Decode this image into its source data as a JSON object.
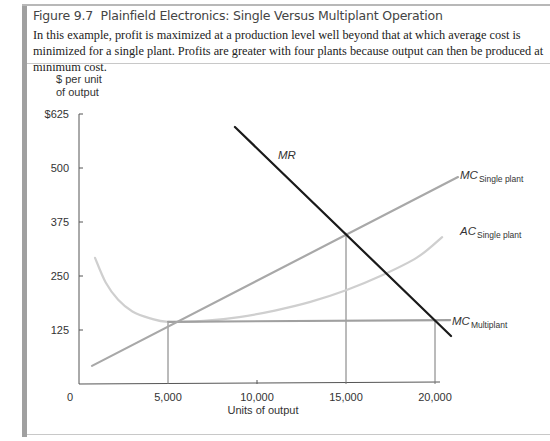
{
  "figure": {
    "number": "Figure 9.7",
    "title": "Plainfield Electronics: Single Versus Multiplant Operation",
    "description": "In this example, profit is maximized at a production level well beyond that at which average cost is minimized for a single plant. Profits are greater with four plants because output can then be produced at minimum cost."
  },
  "chart_data": {
    "type": "line",
    "title": "Plainfield Electronics: Single Versus Multiplant Operation",
    "xlabel": "Units of output",
    "ylabel": "$ per unit of output",
    "ylabel_lines": [
      "$ per unit",
      "of output"
    ],
    "xlim": [
      0,
      20000
    ],
    "ylim": [
      0,
      625
    ],
    "x_ticks": [
      {
        "value": 0,
        "label": "0"
      },
      {
        "value": 5000,
        "label": "5,000"
      },
      {
        "value": 10000,
        "label": "10,000"
      },
      {
        "value": 15000,
        "label": "15,000"
      },
      {
        "value": 20000,
        "label": "20,000"
      }
    ],
    "y_ticks": [
      {
        "value": 125,
        "label": "125"
      },
      {
        "value": 250,
        "label": "250"
      },
      {
        "value": 375,
        "label": "375"
      },
      {
        "value": 500,
        "label": "500"
      },
      {
        "value": 625,
        "label": "$625"
      }
    ],
    "grid": false,
    "series": [
      {
        "name": "MR",
        "label_main": "MR",
        "label_sub": "",
        "color": "#1a1a1a",
        "kind": "line",
        "points": [
          [
            8760,
            595
          ],
          [
            20900,
            111
          ]
        ]
      },
      {
        "name": "MC Single plant",
        "label_main": "MC",
        "label_sub": "Single plant",
        "color": "#a8a8a8",
        "kind": "line",
        "points": [
          [
            730,
            42
          ],
          [
            21290,
            479
          ]
        ]
      },
      {
        "name": "AC Single plant",
        "label_main": "AC",
        "label_sub": "Single plant",
        "color": "#cfcfcf",
        "kind": "curve",
        "points": [
          [
            900,
            292
          ],
          [
            1500,
            235
          ],
          [
            2200,
            195
          ],
          [
            3000,
            168
          ],
          [
            4000,
            152
          ],
          [
            5000,
            144
          ],
          [
            7000,
            146
          ],
          [
            9000,
            155
          ],
          [
            11000,
            170
          ],
          [
            13000,
            190
          ],
          [
            15000,
            217
          ],
          [
            17000,
            251
          ],
          [
            19000,
            293
          ],
          [
            20400,
            340
          ]
        ]
      },
      {
        "name": "MC Multiplant",
        "label_main": "MC",
        "label_sub": "Multiplant",
        "color": "#a0a0a0",
        "kind": "line",
        "points": [
          [
            5000,
            144
          ],
          [
            20850,
            148
          ]
        ]
      }
    ],
    "reference_lines": [
      {
        "name": "q-5000-drop",
        "x": 5000,
        "y": 144
      },
      {
        "name": "q-15000-drop",
        "x": 15000,
        "y": 350
      },
      {
        "name": "q-20000-drop",
        "x": 20000,
        "y": 146
      }
    ]
  }
}
